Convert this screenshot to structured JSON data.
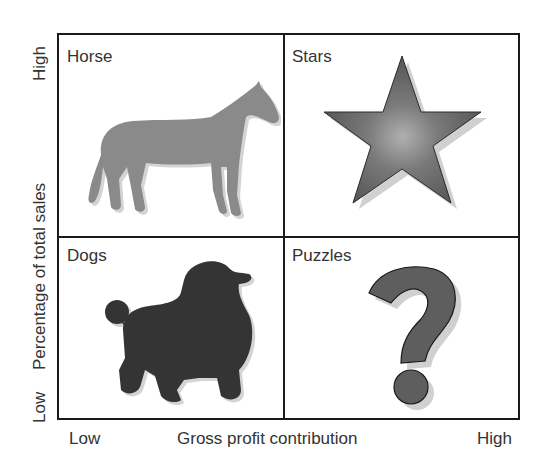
{
  "diagram": {
    "type": "2x2 matrix",
    "x_axis": {
      "label": "Gross profit contribution",
      "low": "Low",
      "high": "High"
    },
    "y_axis": {
      "label": "Percentage of total sales",
      "low": "Low",
      "high": "High"
    },
    "quadrants": {
      "top_left": {
        "label": "Horse",
        "icon": "horse-icon"
      },
      "top_right": {
        "label": "Stars",
        "icon": "star-icon"
      },
      "bottom_left": {
        "label": "Dogs",
        "icon": "poodle-icon"
      },
      "bottom_right": {
        "label": "Puzzles",
        "icon": "question-mark-icon"
      }
    },
    "colors": {
      "horse": "#8a8a8a",
      "star": "#6e6e6e",
      "dog": "#3a3a3a",
      "question": "#5e5e5e",
      "border": "#1a1a1a"
    }
  }
}
